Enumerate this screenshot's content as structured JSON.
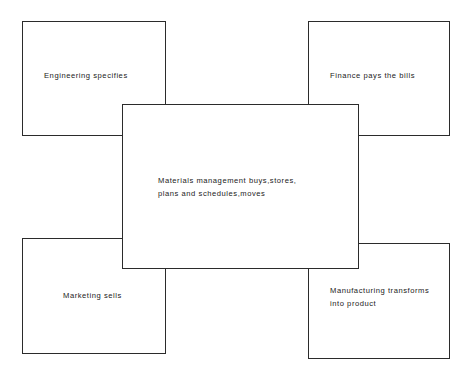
{
  "diagram": {
    "type": "overlapping-box-relationship-diagram",
    "background_color": "#ffffff",
    "stroke_color": "#2b2b2b",
    "text_color": "#222222",
    "nodes": [
      {
        "id": "engineering",
        "label": "Engineering specifies",
        "position": "top-left"
      },
      {
        "id": "finance",
        "label": "Finance pays the bills",
        "position": "top-right"
      },
      {
        "id": "materials",
        "label": "Materials  management buys,stores,\nplans and schedules,moves",
        "position": "center"
      },
      {
        "id": "marketing",
        "label": "Marketing sells",
        "position": "bottom-left"
      },
      {
        "id": "manufacturing",
        "label": "Manufacturing transforms\ninto product",
        "position": "bottom-right"
      }
    ]
  }
}
